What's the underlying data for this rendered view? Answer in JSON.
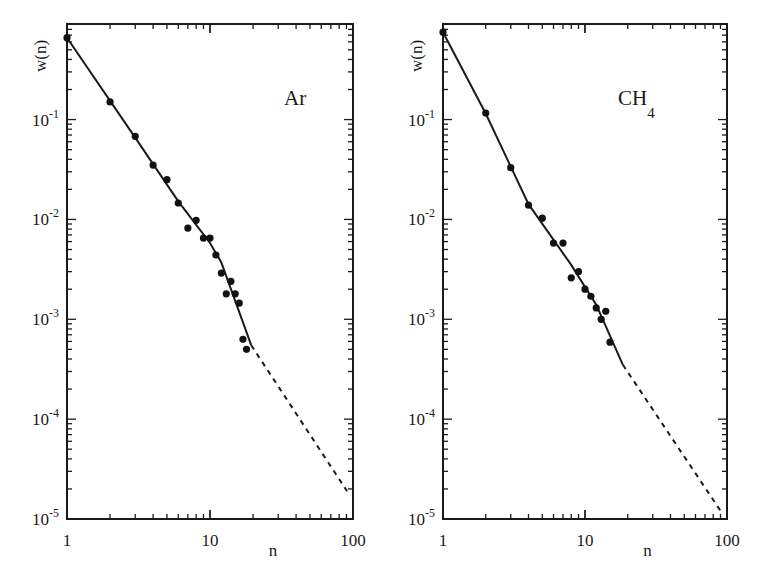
{
  "figure": {
    "panels": [
      "Ar",
      "CH4"
    ]
  },
  "chart_data": [
    {
      "type": "scatter",
      "title": "",
      "annotation": "Ar",
      "annotation_sub": "",
      "xlabel": "n",
      "ylabel": "w(n)",
      "xscale": "log",
      "yscale": "log",
      "xlim": [
        1,
        100
      ],
      "ylim": [
        1e-05,
        0.9
      ],
      "xticks": [
        1,
        10,
        100
      ],
      "xtick_labels": [
        "1",
        "10",
        "100"
      ],
      "yticks": [
        0.1,
        0.01,
        0.001,
        0.0001,
        1e-05
      ],
      "ytick_labels": [
        [
          "10",
          "-1"
        ],
        [
          "10",
          "-2"
        ],
        [
          "10",
          "-3"
        ],
        [
          "10",
          "-4"
        ],
        [
          "10",
          "-5"
        ]
      ],
      "grid": false,
      "legend": null,
      "frame": {
        "left": 67,
        "top": 24,
        "right": 353,
        "bottom": 519
      },
      "points": {
        "x": [
          1,
          2,
          3,
          4,
          5,
          6,
          7,
          8,
          9,
          10,
          11,
          12,
          13,
          14,
          15,
          16,
          17,
          18
        ],
        "y": [
          0.66,
          0.15,
          0.068,
          0.035,
          0.025,
          0.0146,
          0.0082,
          0.0098,
          0.0065,
          0.0065,
          0.0044,
          0.0029,
          0.0018,
          0.0024,
          0.0018,
          0.00145,
          0.00063,
          0.0005
        ]
      },
      "fit_solid": {
        "x": [
          1,
          3,
          6,
          10,
          12,
          19.4
        ],
        "y": [
          0.66,
          0.066,
          0.0152,
          0.0058,
          0.0037,
          0.00055
        ]
      },
      "fit_dashed": {
        "x": [
          19.4,
          91
        ],
        "y": [
          0.00055,
          1.9e-05
        ]
      }
    },
    {
      "type": "scatter",
      "title": "",
      "annotation": "CH",
      "annotation_sub": "4",
      "xlabel": "n",
      "ylabel": "w(n)",
      "xscale": "log",
      "yscale": "log",
      "xlim": [
        1,
        100
      ],
      "ylim": [
        1e-05,
        0.9
      ],
      "xticks": [
        1,
        10,
        100
      ],
      "xtick_labels": [
        "1",
        "10",
        "100"
      ],
      "yticks": [
        0.1,
        0.01,
        0.001,
        0.0001,
        1e-05
      ],
      "ytick_labels": [
        [
          "10",
          "-1"
        ],
        [
          "10",
          "-2"
        ],
        [
          "10",
          "-3"
        ],
        [
          "10",
          "-4"
        ],
        [
          "10",
          "-5"
        ]
      ],
      "grid": false,
      "legend": null,
      "frame": {
        "left": 443,
        "top": 24,
        "right": 727,
        "bottom": 519
      },
      "points": {
        "x": [
          1,
          2,
          3,
          4,
          5,
          6,
          7,
          8,
          9,
          10,
          11,
          12,
          13,
          14,
          15
        ],
        "y": [
          0.75,
          0.116,
          0.033,
          0.0139,
          0.0103,
          0.0058,
          0.0058,
          0.0026,
          0.003,
          0.002,
          0.0017,
          0.0013,
          0.001,
          0.0012,
          0.00059
        ]
      },
      "fit_solid": {
        "x": [
          1,
          2,
          4,
          8,
          12,
          18.5
        ],
        "y": [
          0.75,
          0.115,
          0.0142,
          0.0035,
          0.0014,
          0.00035
        ]
      },
      "fit_dashed": {
        "x": [
          18.5,
          92
        ],
        "y": [
          0.00035,
          1.15e-05
        ]
      }
    }
  ]
}
